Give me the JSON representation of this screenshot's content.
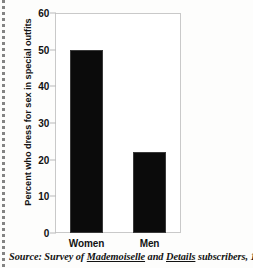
{
  "figure": {
    "source_note": {
      "prefix": "Source: Survey of ",
      "publication_1": "Mademoiselle",
      "conjunction": " and ",
      "publication_2": "Details",
      "suffix": " subscribers, 1993"
    }
  },
  "chart_data": {
    "type": "bar",
    "title": "",
    "xlabel": "",
    "ylabel": "Percent who dress for sex in special outfits",
    "categories": [
      "Women",
      "Men"
    ],
    "values": [
      50,
      22
    ],
    "ylim": [
      0,
      60
    ],
    "yticks": [
      0,
      10,
      20,
      30,
      40,
      50,
      60
    ],
    "ytick_labels": [
      "0",
      "10",
      "20",
      "30",
      "40",
      "50",
      "60"
    ],
    "grid": false,
    "legend": false,
    "legend_position": "none",
    "bar_color": "#0b0b0b",
    "frame_color": "#c9c9c9"
  }
}
